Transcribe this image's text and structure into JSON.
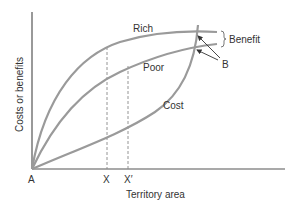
{
  "diagram": {
    "y_axis_label": "Costs or benefits",
    "x_axis_label": "Territory area",
    "origin_label": "A",
    "tick_labels": [
      "X",
      "X′"
    ],
    "curves": [
      {
        "name": "Rich",
        "label": "Rich"
      },
      {
        "name": "Poor",
        "label": "Poor"
      },
      {
        "name": "Cost",
        "label": "Cost"
      }
    ],
    "annotations": {
      "benefit": "Benefit",
      "b_point": "B"
    },
    "colors": {
      "curve": "#9a9a9a",
      "axis": "#555555",
      "text": "#333333",
      "dashed": "#888888"
    }
  }
}
